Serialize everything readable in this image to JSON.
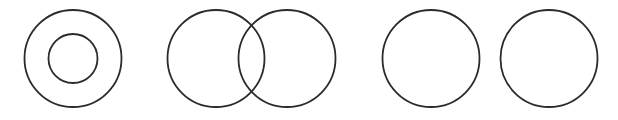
{
  "diagram": {
    "stroke_color": "#2b2b2b",
    "background": "#ffffff",
    "groups": [
      {
        "name": "concentric",
        "circles": [
          {
            "cx": 73,
            "cy": 58.5,
            "r": 48.5
          },
          {
            "cx": 73,
            "cy": 58.5,
            "r": 24.5
          }
        ]
      },
      {
        "name": "overlapping",
        "circles": [
          {
            "cx": 216,
            "cy": 58.5,
            "r": 48.5
          },
          {
            "cx": 287,
            "cy": 58.5,
            "r": 48.5
          }
        ]
      },
      {
        "name": "separate",
        "circles": [
          {
            "cx": 431,
            "cy": 58.5,
            "r": 48.5
          },
          {
            "cx": 549,
            "cy": 58.5,
            "r": 48.5
          }
        ]
      }
    ]
  }
}
